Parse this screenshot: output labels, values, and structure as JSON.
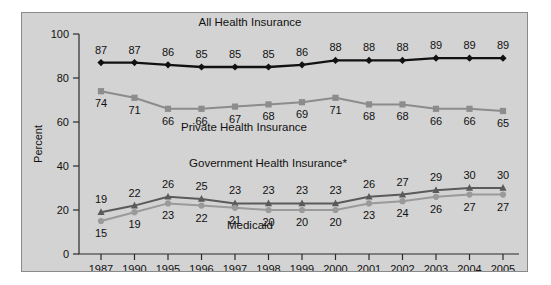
{
  "chart_data": {
    "type": "line",
    "title": "",
    "xlabel": "",
    "ylabel": "Percent",
    "ylim": [
      0,
      100
    ],
    "yticks": [
      0,
      20,
      40,
      60,
      80,
      100
    ],
    "grid": false,
    "legend_position": "inline-annotations",
    "categories": [
      "1987",
      "1990",
      "1995",
      "1996",
      "1997",
      "1998",
      "1999",
      "2000",
      "2001",
      "2002",
      "2003",
      "2004",
      "2005"
    ],
    "series": [
      {
        "name": "All Health Insurance",
        "color": "#111111",
        "marker": "diamond",
        "label_position": "above",
        "values": [
          87,
          87,
          86,
          85,
          85,
          85,
          86,
          88,
          88,
          88,
          89,
          89,
          89
        ]
      },
      {
        "name": "Private Health Insurance",
        "color": "#8c8c8c",
        "marker": "square",
        "label_position": "below",
        "values": [
          74,
          71,
          66,
          66,
          67,
          68,
          69,
          71,
          68,
          68,
          66,
          66,
          65
        ]
      },
      {
        "name": "Government Health Insurance*",
        "color": "#5a5a5a",
        "marker": "triangle",
        "label_position": "above",
        "values": [
          19,
          22,
          26,
          25,
          23,
          23,
          23,
          23,
          26,
          27,
          29,
          30,
          30
        ]
      },
      {
        "name": "Medicaid",
        "color": "#9a9a9a",
        "marker": "circle",
        "label_position": "below",
        "values": [
          15,
          19,
          23,
          22,
          21,
          20,
          20,
          20,
          23,
          24,
          26,
          27,
          27
        ]
      }
    ],
    "annotations": [
      {
        "text": "All Health Insurance",
        "x": 250,
        "y": 26
      },
      {
        "text": "Private Health Insurance",
        "x": 244,
        "y": 131
      },
      {
        "text": "Government Health Insurance*",
        "x": 268,
        "y": 167
      },
      {
        "text": "Medicaid",
        "x": 250,
        "y": 229
      }
    ]
  },
  "figure": {
    "background_color": "#d3d3d3",
    "border_color": "#8a8a8a"
  }
}
